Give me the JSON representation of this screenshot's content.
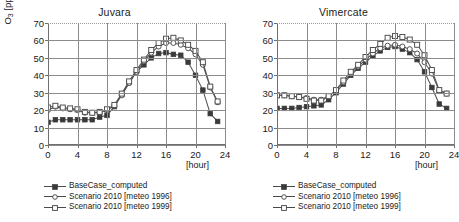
{
  "figure": {
    "y_axis_label_main": "O",
    "y_axis_label_sub": "3",
    "y_axis_label_unit": " [ppb]",
    "x_axis_caption": "[hour]"
  },
  "legend": {
    "items": [
      {
        "label": "BaseCase_computed",
        "marker": "filled-square-marker",
        "color": "#3a3a3a"
      },
      {
        "label": "Scenario 2010 [meteo 1996]",
        "marker": "open-circle-marker",
        "color": "#4a4a4a"
      },
      {
        "label": "Scenario 2010 [meteo 1999]",
        "marker": "open-square-marker",
        "color": "#4a4a4a"
      }
    ]
  },
  "chart_data": [
    {
      "type": "line",
      "title": "Juvara",
      "xlabel": "[hour]",
      "ylabel": "O3 [ppb]",
      "xlim": [
        0,
        24
      ],
      "ylim": [
        0,
        70
      ],
      "xticks": [
        0,
        4,
        8,
        12,
        16,
        20,
        24
      ],
      "yticks": [
        0,
        10,
        20,
        30,
        40,
        50,
        60,
        70
      ],
      "grid": true,
      "legend_position": "below",
      "x": [
        0,
        1,
        2,
        3,
        4,
        5,
        6,
        7,
        8,
        9,
        10,
        11,
        12,
        13,
        14,
        15,
        16,
        17,
        18,
        19,
        20,
        21,
        22,
        23
      ],
      "series": [
        {
          "name": "BaseCase_computed",
          "marker": "filled-square",
          "values": [
            13,
            14.5,
            14.5,
            14.5,
            14.5,
            14.5,
            14.5,
            16,
            17,
            22,
            29,
            36,
            42,
            46,
            50,
            52.5,
            53,
            52,
            51.5,
            47.5,
            40,
            31.5,
            18,
            13.5
          ]
        },
        {
          "name": "Scenario 2010 [meteo 1996]",
          "marker": "open-circle",
          "values": [
            20,
            22,
            21,
            20.5,
            20,
            18.5,
            18.5,
            18.5,
            20,
            22.5,
            28.5,
            35.5,
            42,
            48,
            53,
            56.5,
            58.5,
            58.5,
            57.5,
            55.5,
            52,
            46,
            33,
            24.5
          ]
        },
        {
          "name": "Scenario 2010 [meteo 1999]",
          "marker": "open-square",
          "values": [
            21.5,
            22.5,
            21.5,
            21,
            20.5,
            19,
            18.5,
            19,
            20.5,
            23,
            29.5,
            36.5,
            43,
            49,
            54.5,
            58.5,
            61,
            61.5,
            60,
            57.5,
            54,
            47.5,
            33.5,
            25
          ]
        }
      ]
    },
    {
      "type": "line",
      "title": "Vimercate",
      "xlabel": "[hour]",
      "ylabel": "O3 [ppb]",
      "xlim": [
        0,
        24
      ],
      "ylim": [
        0,
        70
      ],
      "xticks": [
        0,
        4,
        8,
        12,
        16,
        20,
        24
      ],
      "yticks": [
        0,
        10,
        20,
        30,
        40,
        50,
        60,
        70
      ],
      "grid": true,
      "legend_position": "below",
      "x": [
        0,
        1,
        2,
        3,
        4,
        5,
        6,
        7,
        8,
        9,
        10,
        11,
        12,
        13,
        14,
        15,
        16,
        17,
        18,
        19,
        20,
        21,
        22,
        23
      ],
      "series": [
        {
          "name": "BaseCase_computed",
          "marker": "filled-square",
          "values": [
            21,
            21,
            21,
            21.5,
            22,
            22.5,
            23,
            26,
            30,
            35,
            40,
            44,
            47.5,
            51,
            54,
            56,
            56.5,
            55,
            53,
            49,
            42,
            33,
            23.5,
            21
          ]
        },
        {
          "name": "Scenario 2010 [meteo 1996]",
          "marker": "open-circle",
          "values": [
            28.5,
            28.5,
            28,
            27.5,
            27,
            26,
            26,
            28,
            31,
            36,
            41,
            45,
            49,
            52.5,
            55.5,
            57,
            57.5,
            56.5,
            55,
            52.5,
            47.5,
            41,
            31,
            29.5
          ]
        },
        {
          "name": "Scenario 2010 [meteo 1999]",
          "marker": "open-square",
          "values": [
            28.5,
            28.5,
            28,
            27.5,
            26.5,
            25.5,
            25.5,
            28,
            31.5,
            37,
            42,
            46,
            50.5,
            54.5,
            58,
            61.5,
            62.5,
            62,
            60.5,
            57.5,
            51.5,
            43,
            31.5,
            29.5
          ]
        }
      ]
    }
  ]
}
